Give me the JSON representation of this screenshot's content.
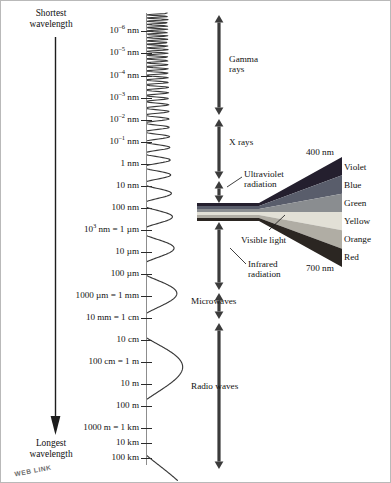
{
  "figure": {
    "direction_top_label": "Shortest\nwavelength",
    "direction_top_line1": "Shortest",
    "direction_top_line2": "wavelength",
    "direction_bottom_line1": "Longest",
    "direction_bottom_line2": "wavelength",
    "watermark": "WEB LINK"
  },
  "scale": {
    "axis_title": "wavelength scale",
    "ticks": [
      {
        "label_html": "10<sup>–6</sup> nm",
        "label_text": "10^-6 nm",
        "y": 30
      },
      {
        "label_html": "10<sup>–5</sup> nm",
        "label_text": "10^-5 nm",
        "y": 52
      },
      {
        "label_html": "10<sup>–4</sup> nm",
        "label_text": "10^-4 nm",
        "y": 75
      },
      {
        "label_html": "10<sup>–3</sup> nm",
        "label_text": "10^-3 nm",
        "y": 97
      },
      {
        "label_html": "10<sup>–2</sup> nm",
        "label_text": "10^-2 nm",
        "y": 119
      },
      {
        "label_html": "10<sup>–1</sup> nm",
        "label_text": "10^-1 nm",
        "y": 141
      },
      {
        "label_html": "1 nm",
        "label_text": "1 nm",
        "y": 163
      },
      {
        "label_html": "10 nm",
        "label_text": "10 nm",
        "y": 185
      },
      {
        "label_html": "100 nm",
        "label_text": "100 nm",
        "y": 207
      },
      {
        "label_html": "10<sup>3</sup> nm = 1 µm",
        "label_text": "10^3 nm = 1 um",
        "y": 229
      },
      {
        "label_html": "10 µm",
        "label_text": "10 um",
        "y": 251
      },
      {
        "label_html": "100 µm",
        "label_text": "100 um",
        "y": 273
      },
      {
        "label_html": "1000 µm = 1 mm",
        "label_text": "1000 um = 1 mm",
        "y": 295
      },
      {
        "label_html": "10 mm = 1 cm",
        "label_text": "10 mm = 1 cm",
        "y": 317
      },
      {
        "label_html": "10 cm",
        "label_text": "10 cm",
        "y": 339
      },
      {
        "label_html": "100 cm = 1 m",
        "label_text": "100 cm = 1 m",
        "y": 361
      },
      {
        "label_html": "10 m",
        "label_text": "10 m",
        "y": 383
      },
      {
        "label_html": "100 m",
        "label_text": "100 m",
        "y": 405
      },
      {
        "label_html": "1000 m = 1 km",
        "label_text": "1000 m = 1 km",
        "y": 427
      },
      {
        "label_html": "10 km",
        "label_text": "10 km",
        "y": 442
      },
      {
        "label_html": "100 km",
        "label_text": "100 km",
        "y": 457
      }
    ]
  },
  "bands": [
    {
      "name": "gamma-rays",
      "label_line1": "Gamma",
      "label_line2": "rays",
      "label_x": 228,
      "label_y": 53,
      "arrow_top": 14,
      "arrow_bottom": 114
    },
    {
      "name": "x-rays",
      "label_line1": "X rays",
      "label_line2": "",
      "label_x": 228,
      "label_y": 136,
      "arrow_top": 118,
      "arrow_bottom": 178
    },
    {
      "name": "ultraviolet-radiation",
      "label_line1": "Ultraviolet",
      "label_line2": "radiation",
      "label_x": 243,
      "label_y": 168,
      "arrow_top": 180,
      "arrow_bottom": 202
    },
    {
      "name": "infrared-radiation",
      "label_line1": "Infrared",
      "label_line2": "radiation",
      "label_x": 247,
      "label_y": 258,
      "arrow_top": 221,
      "arrow_bottom": 289
    },
    {
      "name": "microwaves",
      "label_line1": "Microwaves",
      "label_line2": "",
      "label_x": 190,
      "label_y": 295,
      "arrow_top": 292,
      "arrow_bottom": 318
    },
    {
      "name": "radio-waves",
      "label_line1": "Radio waves",
      "label_line2": "",
      "label_x": 190,
      "label_y": 380,
      "arrow_top": 322,
      "arrow_bottom": 468
    }
  ],
  "visible_light": {
    "label": "Visible light",
    "label_x": 240,
    "label_y": 234,
    "short_wavelength": "400 nm",
    "long_wavelength": "700 nm",
    "colors": [
      {
        "name": "Violet",
        "hex": "#241f2e",
        "y": 162
      },
      {
        "name": "Blue",
        "hex": "#595d6b",
        "y": 180
      },
      {
        "name": "Green",
        "hex": "#8a8d90",
        "y": 198
      },
      {
        "name": "Yellow",
        "hex": "#e2e0d6",
        "y": 216
      },
      {
        "name": "Orange",
        "hex": "#b0ada4",
        "y": 234
      },
      {
        "name": "Red",
        "hex": "#2b2622",
        "y": 252
      }
    ]
  },
  "style_colors": {
    "ink": "#111111",
    "axis": "#8d8d8d",
    "arrow": "#3b3b3b",
    "wave": "#3a3a3a"
  }
}
